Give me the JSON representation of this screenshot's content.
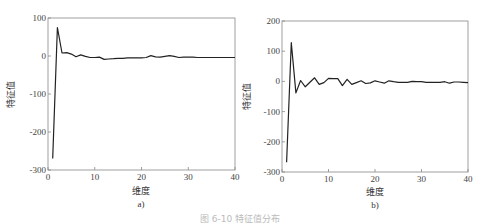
{
  "figure": {
    "caption": "图 6-10 特征值分布",
    "panels": [
      "a)",
      "b)"
    ]
  },
  "chart_data": [
    {
      "type": "line",
      "panel": "a)",
      "title": "",
      "xlabel": "维度",
      "ylabel": "特征值",
      "xlim": [
        0,
        40
      ],
      "ylim": [
        -300,
        100
      ],
      "xticks": [
        0,
        10,
        20,
        30,
        40
      ],
      "yticks": [
        100,
        0,
        -100,
        -200,
        -300
      ],
      "grid": false,
      "x": [
        1,
        2,
        3,
        4,
        5,
        6,
        7,
        8,
        9,
        10,
        11,
        12,
        13,
        14,
        15,
        16,
        17,
        18,
        19,
        20,
        21,
        22,
        23,
        24,
        25,
        26,
        27,
        28,
        29,
        30,
        31,
        32,
        33,
        34,
        35,
        36,
        37,
        38,
        39,
        40
      ],
      "values": [
        -270,
        75,
        8,
        9,
        5,
        -2,
        3,
        -1,
        -4,
        -4,
        -3,
        -9,
        -8,
        -7,
        -6,
        -6,
        -5,
        -5,
        -5,
        -5,
        -4,
        1,
        -2,
        -3,
        -1,
        1,
        -1,
        -4,
        -3,
        -3,
        -3,
        -4,
        -4,
        -4,
        -4,
        -4,
        -4,
        -4,
        -4,
        -4
      ]
    },
    {
      "type": "line",
      "panel": "b)",
      "title": "",
      "xlabel": "维度",
      "ylabel": "特征值",
      "xlim": [
        0,
        40
      ],
      "ylim": [
        -300,
        200
      ],
      "xticks": [
        0,
        10,
        20,
        30,
        40
      ],
      "yticks": [
        200,
        100,
        0,
        -100,
        -200,
        -300
      ],
      "grid": false,
      "x": [
        1,
        2,
        3,
        4,
        5,
        6,
        7,
        8,
        9,
        10,
        11,
        12,
        13,
        14,
        15,
        16,
        17,
        18,
        19,
        20,
        21,
        22,
        23,
        24,
        25,
        26,
        27,
        28,
        29,
        30,
        31,
        32,
        33,
        34,
        35,
        36,
        37,
        38,
        39,
        40
      ],
      "values": [
        -268,
        128,
        -38,
        3,
        -18,
        -3,
        12,
        -10,
        -4,
        10,
        9,
        9,
        -14,
        7,
        -10,
        -4,
        2,
        -7,
        -5,
        2,
        -2,
        -6,
        2,
        -1,
        -3,
        -3,
        -3,
        0,
        -1,
        -1,
        -3,
        -3,
        -3,
        -3,
        -1,
        -6,
        -2,
        -2,
        -3,
        -4
      ]
    }
  ]
}
